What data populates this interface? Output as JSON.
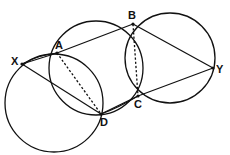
{
  "diagram": {
    "type": "geometry-construction",
    "stroke_color": "#111111",
    "background": "#ffffff",
    "points": {
      "X": {
        "label": "X",
        "x": 22,
        "y": 64
      },
      "A": {
        "label": "A",
        "x": 57,
        "y": 53
      },
      "B": {
        "label": "B",
        "x": 133,
        "y": 24
      },
      "Y": {
        "label": "Y",
        "x": 213,
        "y": 68
      },
      "C": {
        "label": "C",
        "x": 138,
        "y": 96
      },
      "D": {
        "label": "D",
        "x": 101,
        "y": 114
      }
    },
    "circles": [
      {
        "name": "circle-left",
        "cx": 54,
        "cy": 103,
        "r": 49
      },
      {
        "name": "circle-middle",
        "cx": 96,
        "cy": 68,
        "r": 47
      },
      {
        "name": "circle-right",
        "cx": 170,
        "cy": 58,
        "r": 45
      }
    ],
    "solid_segments": [
      [
        "X",
        "A"
      ],
      [
        "A",
        "B"
      ],
      [
        "B",
        "Y"
      ],
      [
        "Y",
        "C"
      ],
      [
        "C",
        "D"
      ],
      [
        "D",
        "X"
      ]
    ],
    "dashed_segments": [
      [
        "A",
        "D"
      ],
      [
        "B",
        "C"
      ]
    ]
  }
}
